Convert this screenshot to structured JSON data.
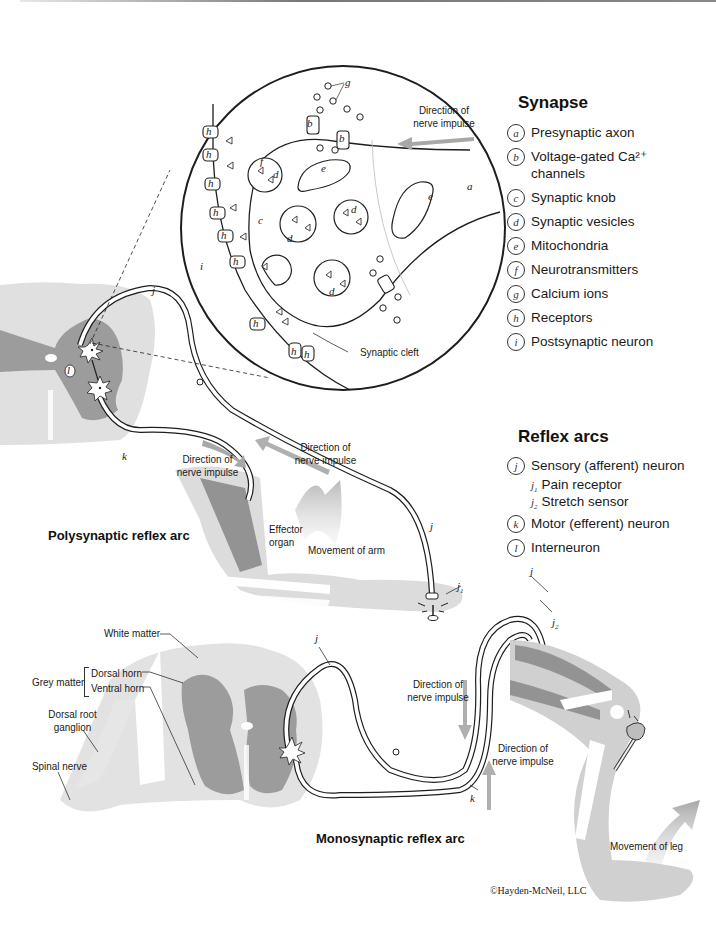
{
  "synapse_legend": {
    "title": "Synapse",
    "items": [
      {
        "key": "a",
        "label": "Presynaptic axon"
      },
      {
        "key": "b",
        "label": "Voltage-gated Ca²⁺",
        "label_line2": "channels"
      },
      {
        "key": "c",
        "label": "Synaptic knob"
      },
      {
        "key": "d",
        "label": "Synaptic vesicles"
      },
      {
        "key": "e",
        "label": "Mitochondria"
      },
      {
        "key": "f",
        "label": "Neurotransmitters"
      },
      {
        "key": "g",
        "label": "Calcium ions"
      },
      {
        "key": "h",
        "label": "Receptors"
      },
      {
        "key": "i",
        "label": "Postsynaptic neuron"
      }
    ]
  },
  "reflex_legend": {
    "title": "Reflex arcs",
    "items": [
      {
        "key": "j",
        "label": "Sensory (afferent) neuron",
        "sub": [
          {
            "key": "j",
            "sub_index": "1",
            "label": "Pain receptor"
          },
          {
            "key": "j",
            "sub_index": "2",
            "label": "Stretch sensor"
          }
        ]
      },
      {
        "key": "k",
        "label": "Motor (efferent) neuron"
      },
      {
        "key": "l",
        "label": "Interneuron"
      }
    ]
  },
  "synapse_diagram": {
    "direction_label_1": "Direction of",
    "direction_label_2": "nerve impulse",
    "synaptic_cleft_label": "Synaptic cleft",
    "letters": {
      "a": "a",
      "b": "b",
      "c": "c",
      "d": "d",
      "e": "e",
      "f": "f",
      "g": "g",
      "h": "h",
      "i": "i"
    }
  },
  "polysynaptic": {
    "title": "Polysynaptic reflex arc",
    "direction_motor_1": "Direction of",
    "direction_motor_2": "nerve impulse",
    "direction_sensory_1": "Direction of",
    "direction_sensory_2": "nerve impulse",
    "effector_1": "Effector",
    "effector_2": "organ",
    "movement": "Movement of arm",
    "letters": {
      "j": "j",
      "j1": "j",
      "j1_sub": "1",
      "k": "k",
      "l": "l"
    }
  },
  "monosynaptic": {
    "title": "Monosynaptic reflex arc",
    "white_matter": "White matter",
    "grey_matter": "Grey matter",
    "dorsal_horn": "Dorsal horn",
    "ventral_horn": "Ventral horn",
    "dorsal_root_1": "Dorsal root",
    "dorsal_root_2": "ganglion",
    "spinal_nerve": "Spinal nerve",
    "direction_down_1": "Direction of",
    "direction_down_2": "nerve impulse",
    "direction_up_1": "Direction of",
    "direction_up_2": "nerve impulse",
    "movement": "Movement of leg",
    "letters": {
      "j_top": "j",
      "j_leg": "j",
      "j2": "j",
      "j2_sub": "2",
      "k": "k"
    }
  },
  "copyright": "©Hayden-McNeil, LLC",
  "colors": {
    "light_grey": "#dcdcdc",
    "mid_grey": "#b4b4b4",
    "dark_grey": "#8e8e8e",
    "arrow_grey": "#b8b8b8",
    "outline": "#1e1e1e"
  }
}
